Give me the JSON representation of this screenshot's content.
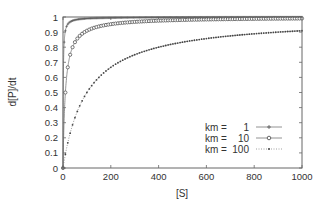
{
  "chart_data": {
    "type": "line",
    "title": "",
    "xlabel": "[S]",
    "ylabel": "d[P]/dt",
    "xlim": [
      0,
      1000
    ],
    "ylim": [
      0,
      1
    ],
    "xticks": [
      0,
      200,
      400,
      600,
      800,
      1000
    ],
    "yticks": [
      0,
      0.1,
      0.2,
      0.3,
      0.4,
      0.5,
      0.6,
      0.7,
      0.8,
      0.9,
      1
    ],
    "xtick_labels": [
      "0",
      "200",
      "400",
      "600",
      "800",
      "1000"
    ],
    "ytick_labels": [
      "0",
      "0.1",
      "0.2",
      "0.3",
      "0.4",
      "0.5",
      "0.6",
      "0.7",
      "0.8",
      "0.9",
      "1"
    ],
    "grid": false,
    "legend_position": "lower right",
    "formula": "d[P]/dt = [S] / (km + [S])",
    "series": [
      {
        "name": "km =    1",
        "km": 1,
        "style": "solid line with small plus markers",
        "x": [
          0,
          5,
          10,
          20,
          50,
          100,
          200,
          400,
          600,
          800,
          1000
        ],
        "values": [
          0,
          0.833,
          0.909,
          0.952,
          0.98,
          0.99,
          0.995,
          0.998,
          0.998,
          0.999,
          0.999
        ]
      },
      {
        "name": "km =   10",
        "km": 10,
        "style": "line with open circle markers",
        "x": [
          0,
          5,
          10,
          20,
          50,
          100,
          200,
          400,
          600,
          800,
          1000
        ],
        "values": [
          0,
          0.333,
          0.5,
          0.667,
          0.833,
          0.909,
          0.952,
          0.976,
          0.984,
          0.988,
          0.99
        ]
      },
      {
        "name": "km = 100",
        "km": 100,
        "style": "dotted line with small dot markers",
        "x": [
          0,
          10,
          50,
          100,
          200,
          400,
          600,
          800,
          1000
        ],
        "values": [
          0,
          0.091,
          0.333,
          0.5,
          0.667,
          0.8,
          0.857,
          0.889,
          0.909
        ]
      }
    ]
  },
  "legend": {
    "items": [
      {
        "prefix": "km =",
        "value": "1"
      },
      {
        "prefix": "km =",
        "value": "10"
      },
      {
        "prefix": "km =",
        "value": "100"
      }
    ]
  },
  "colors": {
    "axis": "#555555",
    "curve": "#666666",
    "marker": "#555555"
  }
}
